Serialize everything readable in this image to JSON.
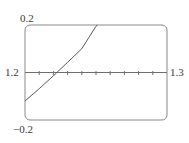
{
  "chart_data": {
    "type": "line",
    "title": "",
    "xlabel": "",
    "ylabel": "",
    "xlim": [
      1.2,
      1.3
    ],
    "ylim": [
      -0.2,
      0.2
    ],
    "x_tick_labels": [
      "1.2",
      "1.3"
    ],
    "y_tick_labels": [
      "0.2",
      "-0.2"
    ],
    "x_minor_ticks": [
      1.21,
      1.22,
      1.23,
      1.24,
      1.25,
      1.26,
      1.27,
      1.28,
      1.29
    ],
    "grid": false,
    "legend": null,
    "series": [
      {
        "name": "f(x)",
        "x": [
          1.2,
          1.21,
          1.22,
          1.23,
          1.24,
          1.25,
          1.251
        ],
        "values": [
          -0.12,
          -0.068,
          -0.014,
          0.043,
          0.1,
          0.195,
          0.2
        ]
      }
    ],
    "annotations": {
      "y_top": "0.2",
      "y_bottom": "−0.2",
      "x_left": "1.2",
      "x_right": "1.3"
    }
  },
  "colors": {
    "frame": "#8a8a8a",
    "axis": "#6e6e6e",
    "curve": "#5a5a5a",
    "text": "#3a3a3a"
  }
}
